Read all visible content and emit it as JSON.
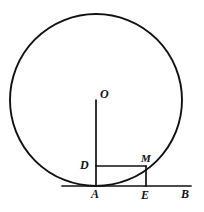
{
  "figure": {
    "kind": "geometry-diagram",
    "background_color": "#ffffff",
    "stroke_color": "#111111",
    "canvas": {
      "width": 204,
      "height": 212
    },
    "circle": {
      "name": "main-circle",
      "center_x": 96,
      "center_y": 100,
      "radius": 86,
      "stroke_width": 1.9
    },
    "points": [
      {
        "id": "O",
        "label": "O",
        "x": 96,
        "y": 100,
        "role": "circle-center"
      },
      {
        "id": "D",
        "label": "D",
        "x": 96,
        "y": 166,
        "role": "foot-on-radius"
      },
      {
        "id": "M",
        "label": "M",
        "x": 146,
        "y": 166,
        "role": "point-on-circle"
      },
      {
        "id": "A",
        "label": "A",
        "x": 96,
        "y": 186,
        "role": "tangency-point"
      },
      {
        "id": "E",
        "label": "E",
        "x": 146,
        "y": 186,
        "role": "foot-on-baseline"
      },
      {
        "id": "B",
        "label": "B",
        "x": 190,
        "y": 186,
        "role": "baseline-end"
      }
    ],
    "segments": [
      {
        "name": "segment-OA",
        "from": "O",
        "to": "A",
        "x1": 96,
        "y1": 100,
        "x2": 96,
        "y2": 186,
        "stroke_width": 1.7
      },
      {
        "name": "segment-DM",
        "from": "D",
        "to": "M",
        "x1": 96,
        "y1": 166,
        "x2": 146,
        "y2": 166,
        "stroke_width": 1.7
      },
      {
        "name": "segment-ME",
        "from": "M",
        "to": "E",
        "x1": 146,
        "y1": 166,
        "x2": 146,
        "y2": 186,
        "stroke_width": 1.7
      },
      {
        "name": "segment-AB",
        "from": "A",
        "to": "B",
        "x1": 62,
        "y1": 186,
        "x2": 191,
        "y2": 186,
        "stroke_width": 1.7
      }
    ]
  }
}
